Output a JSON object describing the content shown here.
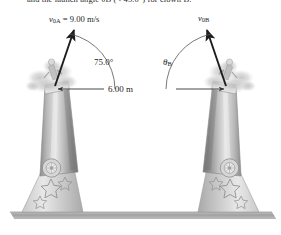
{
  "figure": {
    "caption_fragment": "and the launch angle θB (< 45.0°) for clown B.",
    "background_color": "#ffffff",
    "width": 281,
    "height": 235
  },
  "labels": {
    "velocity_a": {
      "symbol": "v",
      "subscript": "0A",
      "equals": " = ",
      "value": "9.00 m/s",
      "full": "v0A = 9.00 m/s"
    },
    "velocity_b": {
      "symbol": "v",
      "subscript": "0B",
      "full": "v0B"
    },
    "angle_a": {
      "value": "75.0°"
    },
    "angle_b": {
      "symbol": "θ",
      "subscript": "B",
      "full": "θB"
    },
    "distance": {
      "value": "6.00 m"
    }
  },
  "physics": {
    "initial_speed_a_m_s": 9.0,
    "launch_angle_a_deg": 75.0,
    "launch_angle_b_deg": null,
    "separation_m": 6.0,
    "angle_b_constraint_deg": 45.0
  },
  "colors": {
    "ground": "#a8a8a8",
    "barrel_light": "#dcdcdc",
    "barrel_mid": "#9a9a9a",
    "barrel_dark": "#6e6e6e",
    "smoke": "#cfcfcf",
    "ink": "#1d1d1d",
    "dimension_line": "#555555",
    "star_outline": "#8e8e8e"
  },
  "objects": {
    "cannon_a": {
      "name": "cannon-left",
      "label_side": "left",
      "aim": "up-right"
    },
    "cannon_b": {
      "name": "cannon-right",
      "label_side": "right",
      "aim": "up-left"
    },
    "ground_line": {
      "name": "ground"
    },
    "dimension": {
      "name": "separation-dimension",
      "arrowheads": "both"
    }
  }
}
